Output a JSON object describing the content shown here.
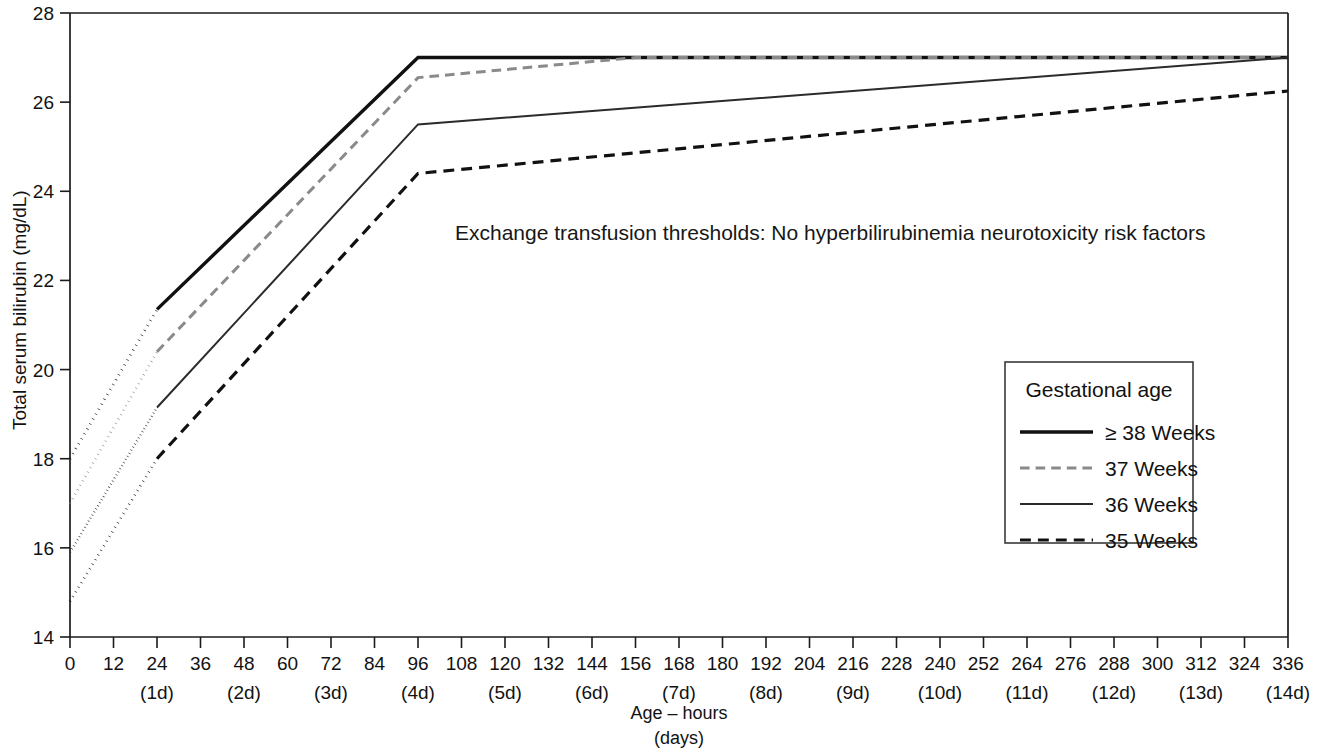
{
  "chart_data": {
    "type": "line",
    "title": "",
    "annotation": "Exchange transfusion thresholds: No hyperbilirubinemia neurotoxicity risk factors",
    "xlabel_line1": "Age – hours",
    "xlabel_line2": "(days)",
    "ylabel": "Total serum bilirubin (mg/dL)",
    "xlim": [
      0,
      336
    ],
    "ylim": [
      14,
      28
    ],
    "grid": false,
    "legend_position": "right-middle",
    "legend_title": "Gestational age",
    "x_ticks": [
      0,
      12,
      24,
      36,
      48,
      60,
      72,
      84,
      96,
      108,
      120,
      132,
      144,
      156,
      168,
      180,
      192,
      204,
      216,
      228,
      240,
      252,
      264,
      276,
      288,
      300,
      312,
      324,
      336
    ],
    "x_tick_labels": [
      "0",
      "12",
      "24",
      "36",
      "48",
      "60",
      "72",
      "84",
      "96",
      "108",
      "120",
      "132",
      "144",
      "156",
      "168",
      "180",
      "192",
      "204",
      "216",
      "228",
      "240",
      "252",
      "264",
      "276",
      "288",
      "300",
      "312",
      "324",
      "336"
    ],
    "x_day_ticks": [
      24,
      48,
      72,
      96,
      120,
      144,
      168,
      192,
      216,
      240,
      264,
      288,
      312,
      336
    ],
    "x_day_labels": [
      "(1d)",
      "(2d)",
      "(3d)",
      "(4d)",
      "(5d)",
      "(6d)",
      "(7d)",
      "(8d)",
      "(9d)",
      "(10d)",
      "(11d)",
      "(12d)",
      "(13d)",
      "(14d)"
    ],
    "y_ticks": [
      14,
      16,
      18,
      20,
      22,
      24,
      26,
      28
    ],
    "y_tick_labels": [
      "14",
      "16",
      "18",
      "20",
      "22",
      "24",
      "26",
      "28"
    ],
    "dotted_segment_range": [
      0,
      24
    ],
    "series": [
      {
        "name": "≥ 38 Weeks",
        "legend_label": "≥ 38 Weeks",
        "style": "solid-thick",
        "color": "#111111",
        "width": 3.4,
        "x": [
          0,
          24,
          96,
          336
        ],
        "values": [
          18.0,
          21.35,
          27.0,
          27.0
        ]
      },
      {
        "name": "37 Weeks",
        "legend_label": "37 Weeks",
        "style": "dashed-gray",
        "color": "#8a8a8a",
        "width": 3.0,
        "x": [
          0,
          24,
          96,
          156,
          336
        ],
        "values": [
          17.0,
          20.4,
          26.55,
          27.0,
          27.0
        ]
      },
      {
        "name": "36 Weeks",
        "legend_label": "36 Weeks",
        "style": "solid-thin",
        "color": "#2b2b2b",
        "width": 2.0,
        "x": [
          0,
          24,
          96,
          336
        ],
        "values": [
          15.9,
          19.15,
          25.5,
          27.0
        ]
      },
      {
        "name": "35 Weeks",
        "legend_label": "35 Weeks",
        "style": "dashed-black",
        "color": "#111111",
        "width": 3.2,
        "x": [
          0,
          24,
          96,
          336
        ],
        "values": [
          14.8,
          18.0,
          24.4,
          26.25
        ]
      }
    ]
  },
  "colors": {
    "axis": "#1b1b1b",
    "text": "#121212",
    "gray_series": "#8a8a8a",
    "black_series": "#111111",
    "background": "#ffffff"
  }
}
